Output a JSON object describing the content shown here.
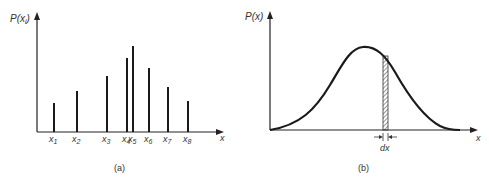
{
  "panel_a": {
    "y_label": "P(x",
    "y_label_sub": "i",
    "y_label_close": ")",
    "x_label": "x",
    "caption": "(a)",
    "ticks": [
      {
        "name": "x",
        "sub": "1"
      },
      {
        "name": "x",
        "sub": "2"
      },
      {
        "name": "x",
        "sub": "3"
      },
      {
        "name": "x",
        "sub": "4"
      },
      {
        "name": "x",
        "sub": "5"
      },
      {
        "name": "x",
        "sub": "6"
      },
      {
        "name": "x",
        "sub": "7"
      },
      {
        "name": "x",
        "sub": "8"
      }
    ]
  },
  "panel_b": {
    "y_label": "P(x)",
    "x_label": "x",
    "interval_label": "dx",
    "caption": "(b)"
  },
  "chart_data": [
    {
      "type": "bar",
      "title": "(a) Discrete probability distribution",
      "xlabel": "x",
      "ylabel": "P(x_i)",
      "categories": [
        "x1",
        "x2",
        "x3",
        "x4",
        "x5",
        "x6",
        "x7",
        "x8"
      ],
      "values": [
        29,
        41,
        56,
        74,
        86,
        64,
        45,
        31
      ],
      "x_positions": [
        54,
        77,
        107,
        127,
        133,
        149,
        168,
        188
      ],
      "grid": false
    },
    {
      "type": "line",
      "title": "(b) Continuous probability density",
      "xlabel": "x",
      "ylabel": "P(x)",
      "shape": "bell curve",
      "annotation": "shaded strip of width dx to the right of the peak",
      "grid": false
    }
  ]
}
